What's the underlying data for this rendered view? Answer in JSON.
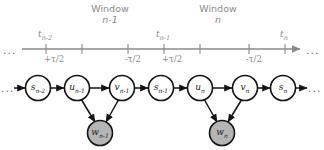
{
  "diagram": {
    "type": "dynamic-bayesian-network-timeline",
    "timeline": {
      "leading_ellipsis": "...",
      "trailing_ellipsis": "...",
      "ticks": [
        {
          "id": "t-n-2",
          "top_label": "t",
          "top_sub": "n-2",
          "bottom_label": "+τ/2",
          "x": 46
        },
        {
          "id": "tick-a",
          "top_label": "",
          "top_sub": "",
          "bottom_label": "",
          "x": 82
        },
        {
          "id": "tick-b",
          "top_label": "",
          "top_sub": "",
          "bottom_label": "-τ/2",
          "x": 128
        },
        {
          "id": "t-n-1",
          "top_label": "t",
          "top_sub": "n-1",
          "bottom_label": "+τ/2",
          "x": 164
        },
        {
          "id": "tick-c",
          "top_label": "",
          "top_sub": "",
          "bottom_label": "",
          "x": 200
        },
        {
          "id": "tick-d",
          "top_label": "",
          "top_sub": "",
          "bottom_label": "-τ/2",
          "x": 249
        },
        {
          "id": "t-n",
          "top_label": "t",
          "top_sub": "n",
          "bottom_label": "",
          "x": 285
        }
      ]
    },
    "windows": [
      {
        "id": "window-n-1",
        "title": "Window",
        "subtitle": "n-1",
        "center_x": 110
      },
      {
        "id": "window-n",
        "title": "Window",
        "subtitle": "n",
        "center_x": 218
      }
    ],
    "chain_nodes": [
      {
        "id": "s-n-2",
        "label": "s",
        "sub": "n-2",
        "x": 38,
        "y": 88,
        "shaded": false
      },
      {
        "id": "u-n-1",
        "label": "u",
        "sub": "n-1",
        "x": 77,
        "y": 88,
        "shaded": false
      },
      {
        "id": "v-n-1",
        "label": "v",
        "sub": "n-1",
        "x": 122,
        "y": 88,
        "shaded": false
      },
      {
        "id": "s-n-1",
        "label": "s",
        "sub": "n-1",
        "x": 161,
        "y": 88,
        "shaded": false
      },
      {
        "id": "u-n",
        "label": "u",
        "sub": "n",
        "x": 200,
        "y": 88,
        "shaded": false
      },
      {
        "id": "v-n",
        "label": "v",
        "sub": "n",
        "x": 245,
        "y": 88,
        "shaded": false
      },
      {
        "id": "s-n",
        "label": "s",
        "sub": "n",
        "x": 283,
        "y": 88,
        "shaded": false
      }
    ],
    "observation_nodes": [
      {
        "id": "w-n-1",
        "label": "w",
        "sub": "n-1",
        "x": 100,
        "y": 133,
        "shaded": true
      },
      {
        "id": "w-n",
        "label": "w",
        "sub": "n",
        "x": 222,
        "y": 133,
        "shaded": true
      }
    ],
    "colors": {
      "axis": "#8a8a8a",
      "node_stroke": "#141414",
      "node_fill": "#ffffff",
      "shaded_fill": "#b5b5b5",
      "label_text": "#1a1a1a",
      "axis_text": "#8a8a8a"
    }
  }
}
